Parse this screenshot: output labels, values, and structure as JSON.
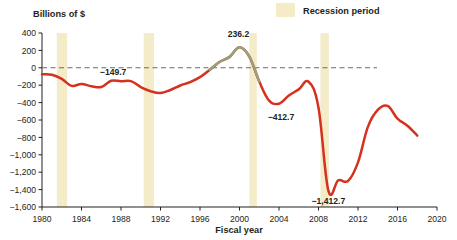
{
  "chart_data": {
    "type": "line",
    "title": "",
    "ylabel": "Billions of $",
    "xlabel": "Fiscal year",
    "xlim": [
      1980,
      2020
    ],
    "ylim": [
      -1600,
      400
    ],
    "grid": false,
    "y_ticks": [
      400,
      200,
      0,
      -200,
      -400,
      -600,
      -800,
      -1000,
      -1200,
      -1400,
      -1600
    ],
    "y_tick_labels": [
      "400",
      "200",
      "0",
      "-200",
      "-400",
      "-600",
      "-800",
      "-1,000",
      "-1,200",
      "-1,400",
      "-1,600"
    ],
    "x_ticks": [
      1980,
      1984,
      1988,
      1992,
      1996,
      2000,
      2004,
      2008,
      2012,
      2016,
      2020
    ],
    "x_tick_labels": [
      "1980",
      "1984",
      "1988",
      "1992",
      "1996",
      "2000",
      "2004",
      "2008",
      "2012",
      "2016",
      "2020"
    ],
    "zero_line": 0,
    "series": [
      {
        "name": "Federal budget surplus or deficit",
        "color": "#d6301f",
        "surplus_color": "#9aa07a",
        "x": [
          1980,
          1981,
          1982,
          1983,
          1984,
          1985,
          1986,
          1987,
          1988,
          1989,
          1990,
          1991,
          1992,
          1993,
          1994,
          1995,
          1996,
          1997,
          1998,
          1999,
          2000,
          2001,
          2002,
          2003,
          2004,
          2005,
          2006,
          2007,
          2008,
          2009,
          2010,
          2011,
          2012,
          2013,
          2014,
          2015,
          2016,
          2017,
          2018
        ],
        "values": [
          -73.8,
          -79.0,
          -128.0,
          -207.8,
          -185.4,
          -212.3,
          -221.2,
          -149.7,
          -155.2,
          -152.6,
          -221.0,
          -269.2,
          -290.3,
          -255.1,
          -203.2,
          -164.0,
          -107.4,
          -21.9,
          69.3,
          125.6,
          236.2,
          128.2,
          -157.8,
          -377.6,
          -412.7,
          -318.3,
          -248.2,
          -160.7,
          -458.6,
          -1412.7,
          -1294.4,
          -1300.0,
          -1087.0,
          -679.5,
          -484.6,
          -438.5,
          -585.0,
          -665.4,
          -779.0
        ]
      }
    ],
    "annotations": [
      {
        "label": "-149.7",
        "x": 1987,
        "y": -149.7
      },
      {
        "label": "236.2",
        "x": 2000,
        "y": 236.2
      },
      {
        "label": "-412.7",
        "x": 2004,
        "y": -412.7
      },
      {
        "label": "-1,412.7",
        "x": 2009,
        "y": -1412.7
      }
    ],
    "recession_bands": [
      {
        "start": 1981.5,
        "end": 1982.55
      },
      {
        "start": 1990.3,
        "end": 1991.35
      },
      {
        "start": 2001.0,
        "end": 2001.75
      },
      {
        "start": 2008.2,
        "end": 2009.05
      }
    ],
    "recession_color": "#f4ebc9"
  },
  "legend": {
    "recession_label": "Recession period",
    "swatch_color": "#f4ebc9"
  },
  "labels": {
    "y_axis_title": "Billions of $",
    "x_axis_title": "Fiscal year"
  },
  "icons": {
    "legend_swatch": "recession-swatch-icon"
  }
}
